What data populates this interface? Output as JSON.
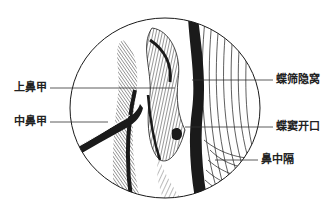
{
  "figure": {
    "labels_left": [
      {
        "id": "superior-turbinate",
        "text": "上鼻甲"
      },
      {
        "id": "middle-turbinate",
        "text": "中鼻甲"
      }
    ],
    "labels_right": [
      {
        "id": "sphenoethmoidal-recess",
        "text": "蝶筛隐窝"
      },
      {
        "id": "sphenoid-sinus-ostium",
        "text": "蝶窦开口"
      },
      {
        "id": "nasal-septum",
        "text": "鼻中隔"
      }
    ],
    "colors": {
      "ink": "#1a1a1a",
      "background": "#ffffff",
      "leader": "#333333"
    }
  }
}
